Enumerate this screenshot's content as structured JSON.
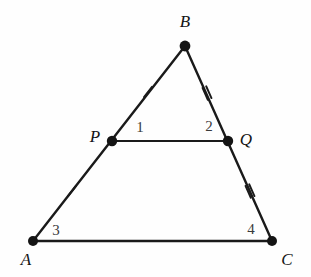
{
  "figure": {
    "kind": "geometry-diagram",
    "background_color": "#fefefe",
    "stroke_color": "#1a1a1a",
    "label_color": "#141414",
    "angle_label_color": "#3a3a3a",
    "width": 311,
    "height": 277
  },
  "points": [
    {
      "id": "A",
      "label": "A",
      "x": 33,
      "y": 241,
      "label_x": 26,
      "label_y": 259,
      "dot_r": 5.0
    },
    {
      "id": "B",
      "label": "B",
      "x": 185,
      "y": 46,
      "label_x": 185,
      "label_y": 21,
      "dot_r": 5.4
    },
    {
      "id": "C",
      "label": "C",
      "x": 272,
      "y": 241,
      "label_x": 287,
      "label_y": 259,
      "dot_r": 5.0
    },
    {
      "id": "P",
      "label": "P",
      "x": 112,
      "y": 141,
      "label_x": 95,
      "label_y": 136,
      "dot_r": 5.2
    },
    {
      "id": "Q",
      "label": "Q",
      "x": 228,
      "y": 141,
      "label_x": 246,
      "label_y": 139,
      "dot_r": 5.2
    }
  ],
  "segments": [
    {
      "id": "AB",
      "from": "A",
      "to": "B",
      "x1": 33,
      "y1": 241,
      "x2": 185,
      "y2": 46,
      "width": 2.4
    },
    {
      "id": "BC",
      "from": "B",
      "to": "C",
      "x1": 185,
      "y1": 46,
      "x2": 272,
      "y2": 241,
      "width": 2.4
    },
    {
      "id": "AC",
      "from": "A",
      "to": "C",
      "x1": 33,
      "y1": 241,
      "x2": 272,
      "y2": 241,
      "width": 2.6
    },
    {
      "id": "PQ",
      "from": "P",
      "to": "Q",
      "x1": 112,
      "y1": 141,
      "x2": 228,
      "y2": 141,
      "width": 2.2
    }
  ],
  "tick_marks": [
    {
      "id": "tick-BP",
      "on_segment": "AB",
      "count": 1,
      "x": 148,
      "y": 92,
      "angle_deg": -52,
      "len": 13
    },
    {
      "id": "tick-PA",
      "on_segment": "AB",
      "count": 1,
      "x": 72,
      "y": 191,
      "angle_deg": -52,
      "len": 13
    },
    {
      "id": "tick-BQ",
      "on_segment": "BC",
      "count": 2,
      "x": 207,
      "y": 93,
      "angle_deg": 66,
      "len": 13
    },
    {
      "id": "tick-QC",
      "on_segment": "BC",
      "count": 2,
      "x": 250,
      "y": 191,
      "angle_deg": 66,
      "len": 13
    }
  ],
  "angle_labels": [
    {
      "id": "angle-1",
      "text": "1",
      "x": 140,
      "y": 127
    },
    {
      "id": "angle-2",
      "text": "2",
      "x": 209,
      "y": 126
    },
    {
      "id": "angle-3",
      "text": "3",
      "x": 56,
      "y": 230
    },
    {
      "id": "angle-4",
      "text": "4",
      "x": 251,
      "y": 229
    }
  ]
}
